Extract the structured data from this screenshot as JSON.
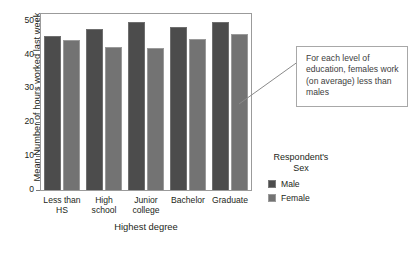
{
  "chart_data": {
    "type": "bar",
    "title": "",
    "xlabel": "Highest degree",
    "ylabel": "Mean Number of hours worked last week",
    "categories": [
      "Less than\nHS",
      "High\nschool",
      "Junior\ncollege",
      "Bachelor",
      "Graduate"
    ],
    "series": [
      {
        "name": "Male",
        "color": "#4c4c4c",
        "values": [
          45.5,
          47.5,
          49.5,
          48.3,
          49.7
        ]
      },
      {
        "name": "Female",
        "color": "#737373",
        "values": [
          44.4,
          42.4,
          42.1,
          44.5,
          46.0
        ]
      }
    ],
    "ylim": [
      0,
      52
    ],
    "yticks": [
      0,
      10,
      20,
      30,
      40,
      50
    ],
    "ytick_labels": [
      "0",
      "10",
      "20",
      "30",
      "40",
      "50"
    ],
    "grid": false,
    "legend_position": "right"
  },
  "legend": {
    "title_line1": "Respondent's",
    "title_line2": "Sex",
    "items": [
      {
        "label": "Male",
        "color": "#4c4c4c"
      },
      {
        "label": "Female",
        "color": "#737373"
      }
    ]
  },
  "annotation": {
    "text": "For each level of education, females work (on average) less than males"
  }
}
